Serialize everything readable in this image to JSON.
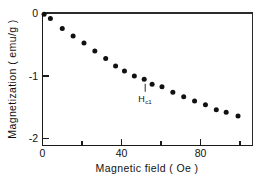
{
  "chart_data": {
    "type": "scatter",
    "title": "",
    "xlabel": "Magnetic  field  ( Oe )",
    "ylabel": "Magnetization  ( emu/g )",
    "xlim": [
      0,
      106
    ],
    "ylim": [
      -2.3,
      0.05
    ],
    "grid": false,
    "legend": null,
    "x_major_ticks": [
      0,
      40,
      80
    ],
    "x_major_tick_labels": [
      "0",
      "40",
      "80"
    ],
    "x_minor_ticks": [
      20,
      60,
      100
    ],
    "y_major_ticks": [
      0,
      -1,
      -2
    ],
    "y_major_tick_labels": [
      "0",
      "-1",
      "-2"
    ],
    "marker": "filled-circle",
    "marker_color": "#111111",
    "x": [
      0.8,
      4.0,
      10.0,
      15.5,
      21.0,
      26.5,
      32.0,
      37.0,
      41.5,
      46.5,
      51.5,
      55.5,
      60.5,
      66.0,
      71.5,
      77.0,
      82.5,
      88.0,
      93.0,
      99.0
    ],
    "y": [
      -0.01,
      -0.08,
      -0.24,
      -0.36,
      -0.47,
      -0.6,
      -0.72,
      -0.84,
      -0.92,
      -1.0,
      -1.05,
      -1.13,
      -1.17,
      -1.26,
      -1.33,
      -1.4,
      -1.46,
      -1.54,
      -1.58,
      -1.64
    ],
    "annotations": [
      {
        "name": "hc1-label",
        "text": "H",
        "subscript": "c1",
        "x": 52.0,
        "y": -1.22,
        "pointer": "up-tick"
      }
    ]
  },
  "figure": {
    "background_color": "#ffffff",
    "axis_color": "#1a1a1a",
    "marker_color": "#111111"
  }
}
